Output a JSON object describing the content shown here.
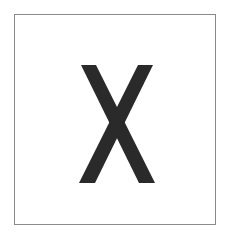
{
  "card": {
    "symbol": "X",
    "symbol_color": "#2a2a2a",
    "border_color": "#8a8a8a",
    "background": "#ffffff"
  }
}
